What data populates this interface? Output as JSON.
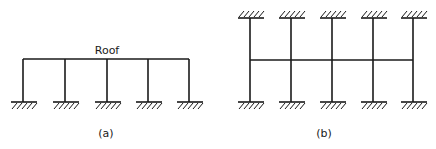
{
  "figure_a": {
    "caption": "(a)",
    "beam_label": "Roof",
    "description": "Single-storey portal frame, five columns fixed at base, one roof beam",
    "columns": 5
  },
  "figure_b": {
    "caption": "(b)",
    "description": "Five columns fixed at both top and bottom supports, one intermediate horizontal beam",
    "columns": 5
  }
}
